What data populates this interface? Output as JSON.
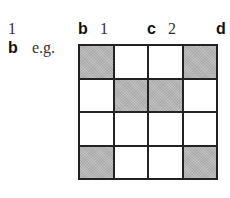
{
  "header_row": {
    "item_1": "1",
    "b_label": "b",
    "b_value": "1",
    "c_label": "c",
    "c_value": "2",
    "d_label": "d"
  },
  "second_row": {
    "b_label": "b",
    "example_text": "e.g."
  },
  "grid": {
    "rows": 4,
    "cols": 4,
    "shaded_color": "#b8b8b8",
    "cells": [
      [
        1,
        0,
        0,
        1
      ],
      [
        0,
        1,
        1,
        0
      ],
      [
        0,
        0,
        0,
        0
      ],
      [
        1,
        0,
        0,
        1
      ]
    ]
  }
}
